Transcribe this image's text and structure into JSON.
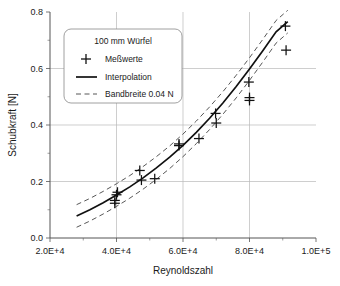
{
  "chart_data": {
    "type": "scatter",
    "title": "",
    "xlabel": "Reynoldszahl",
    "ylabel": "Schubkraft [N]",
    "xlim": [
      20000,
      100000
    ],
    "ylim": [
      0.0,
      0.8
    ],
    "grid": true,
    "xticks": [
      20000,
      40000,
      60000,
      80000,
      100000
    ],
    "xticklabels": [
      "2.0E+4",
      "4.0E+4",
      "6.0E+4",
      "8.0E+4",
      "1.0E+5"
    ],
    "xminor_step": 10000,
    "yticks": [
      0.0,
      0.2,
      0.4,
      0.6,
      0.8
    ],
    "yticklabels": [
      "0.0",
      "0.2",
      "0.4",
      "0.6",
      "0.8"
    ],
    "yminor_step": 0.1,
    "legend_position": "upper-left-inside",
    "legend_title": "100 mm Würfel",
    "series": [
      {
        "name": "Meßwerte",
        "type": "scatter",
        "marker": "plus",
        "points": [
          {
            "x": 39500,
            "y": 0.133
          },
          {
            "x": 39500,
            "y": 0.123
          },
          {
            "x": 40000,
            "y": 0.153
          },
          {
            "x": 40300,
            "y": 0.162
          },
          {
            "x": 47000,
            "y": 0.239
          },
          {
            "x": 47500,
            "y": 0.205
          },
          {
            "x": 51500,
            "y": 0.21
          },
          {
            "x": 58800,
            "y": 0.327
          },
          {
            "x": 58800,
            "y": 0.333
          },
          {
            "x": 64800,
            "y": 0.352
          },
          {
            "x": 69800,
            "y": 0.441
          },
          {
            "x": 70000,
            "y": 0.407
          },
          {
            "x": 79800,
            "y": 0.552
          },
          {
            "x": 80000,
            "y": 0.497
          },
          {
            "x": 80000,
            "y": 0.487
          },
          {
            "x": 90800,
            "y": 0.75
          },
          {
            "x": 91000,
            "y": 0.665
          }
        ]
      },
      {
        "name": "Interpolation",
        "type": "line",
        "style": "solid",
        "points": [
          {
            "x": 28000,
            "y": 0.078
          },
          {
            "x": 32000,
            "y": 0.1
          },
          {
            "x": 36000,
            "y": 0.125
          },
          {
            "x": 40000,
            "y": 0.152
          },
          {
            "x": 44000,
            "y": 0.181
          },
          {
            "x": 48000,
            "y": 0.213
          },
          {
            "x": 52000,
            "y": 0.248
          },
          {
            "x": 56000,
            "y": 0.286
          },
          {
            "x": 60000,
            "y": 0.328
          },
          {
            "x": 64000,
            "y": 0.374
          },
          {
            "x": 68000,
            "y": 0.424
          },
          {
            "x": 72000,
            "y": 0.478
          },
          {
            "x": 76000,
            "y": 0.536
          },
          {
            "x": 80000,
            "y": 0.598
          },
          {
            "x": 84000,
            "y": 0.663
          },
          {
            "x": 88000,
            "y": 0.73
          },
          {
            "x": 91500,
            "y": 0.766
          }
        ]
      },
      {
        "name": "Bandbreite 0.04 N",
        "type": "line",
        "style": "dashed",
        "offset": 0.04,
        "description": "Obere und untere Bandbreite +/- 0.04 N um die Interpolation"
      }
    ],
    "legend_entries": [
      {
        "label": "Meßwerte",
        "marker": "plus-marker"
      },
      {
        "label": "Interpolation",
        "marker": "solid-line"
      },
      {
        "label": "Bandbreite 0.04 N",
        "marker": "dashed-line"
      }
    ],
    "colors": {
      "line": "#111111",
      "band": "#444444",
      "grid": "#b9b9b9",
      "axis": "#555555",
      "background": "#ffffff"
    }
  }
}
